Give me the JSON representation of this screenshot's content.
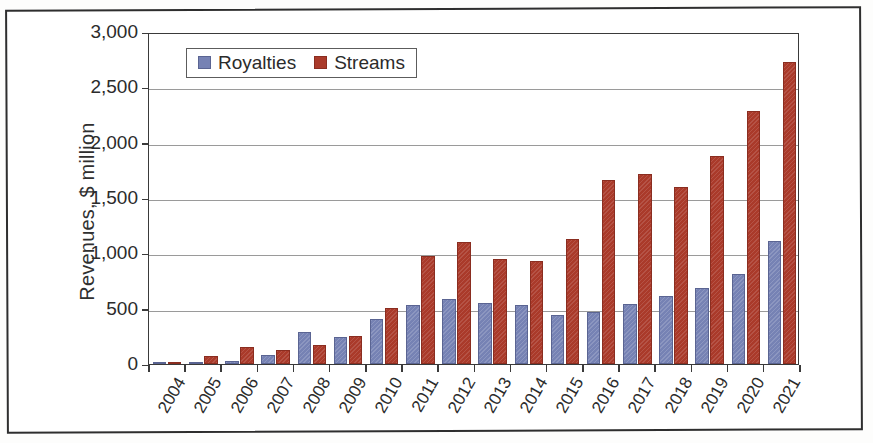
{
  "chart_data": {
    "type": "bar",
    "title": "",
    "subtitle": "",
    "xlabel": "",
    "ylabel": "Revenues, $ million",
    "ylim": [
      0,
      3000
    ],
    "ytick_values": [
      0,
      500,
      1000,
      1500,
      2000,
      2500,
      3000
    ],
    "ytick_labels": [
      "0",
      "500",
      "1,000",
      "1,500",
      "2,000",
      "2,500",
      "3,000"
    ],
    "grid": "horizontal",
    "legend_position": "top-left-inside",
    "categories": [
      "2004",
      "2005",
      "2006",
      "2007",
      "2008",
      "2009",
      "2010",
      "2011",
      "2012",
      "2013",
      "2014",
      "2015",
      "2016",
      "2017",
      "2018",
      "2019",
      "2020",
      "2021"
    ],
    "series": [
      {
        "name": "Royalties",
        "color": "#7682b4",
        "values": [
          5,
          10,
          30,
          85,
          285,
          245,
          405,
          530,
          590,
          550,
          530,
          440,
          470,
          545,
          615,
          690,
          815,
          1110
        ]
      },
      {
        "name": "Streams",
        "color": "#aa3a2a",
        "values": [
          15,
          75,
          155,
          125,
          175,
          250,
          510,
          975,
          1100,
          945,
          930,
          1130,
          1665,
          1720,
          1600,
          1880,
          2290,
          2730
        ]
      }
    ]
  },
  "legend": {
    "entries": [
      {
        "label": "Royalties",
        "color": "#7682b4"
      },
      {
        "label": "Streams",
        "color": "#aa3a2a"
      }
    ]
  },
  "axes": {
    "y_title": "Revenues, $ million"
  }
}
